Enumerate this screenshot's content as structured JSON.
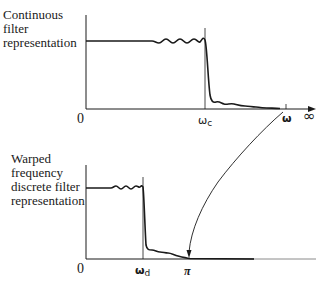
{
  "top_panel": {
    "label_lines": [
      "Continuous",
      "filter",
      "representation"
    ],
    "origin_label": "0",
    "cutoff_label": "ω",
    "cutoff_sub": "c",
    "omega_label": "ω",
    "infinity_label": "∞"
  },
  "bottom_panel": {
    "label_lines": [
      "Warped",
      "frequency",
      "discrete filter",
      "representation"
    ],
    "origin_label": "0",
    "cutoff_label": "ω",
    "cutoff_sub": "d",
    "pi_label": "π"
  },
  "mapping_arrow": {
    "from": "ω (continuous axis)",
    "to": "π (discrete axis)"
  },
  "colors": {
    "line": "#1a1a1a",
    "background": "#ffffff"
  }
}
